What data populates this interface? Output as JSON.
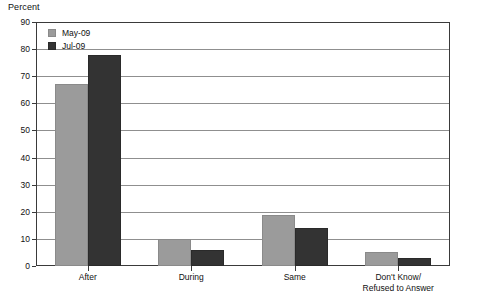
{
  "chart_data": {
    "type": "bar",
    "title": "",
    "xlabel": "",
    "ylabel": "Percent",
    "ylim": [
      0,
      90
    ],
    "yticks": [
      0,
      10,
      20,
      30,
      40,
      50,
      60,
      70,
      80,
      90
    ],
    "grid": true,
    "legend_position": "top-left",
    "categories": [
      "After",
      "During",
      "Same",
      "Don't Know/ Refused to Answer"
    ],
    "category_lines": [
      [
        "After"
      ],
      [
        "During"
      ],
      [
        "Same"
      ],
      [
        "Don't Know/",
        "Refused to Answer"
      ]
    ],
    "series": [
      {
        "name": "May-09",
        "color": "#9b9b9b",
        "values": [
          67,
          10,
          19,
          5
        ]
      },
      {
        "name": "Jul-09",
        "color": "#333333",
        "values": [
          78,
          6,
          14,
          3
        ]
      }
    ]
  },
  "axis": {
    "y_title": "Percent"
  },
  "legend": {
    "items": [
      {
        "label": "May-09"
      },
      {
        "label": "Jul-09"
      }
    ]
  }
}
